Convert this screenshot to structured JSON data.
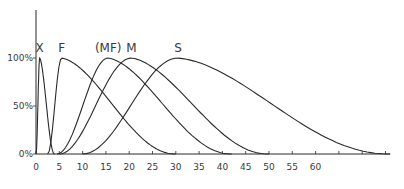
{
  "chart_data": {
    "type": "line",
    "title": "",
    "xlabel": "",
    "ylabel": "",
    "xlim": [
      0,
      76
    ],
    "ylim": [
      0,
      100
    ],
    "grid": false,
    "legend": "inline labels above peaks",
    "x_ticks": [
      0,
      5,
      10,
      15,
      20,
      25,
      30,
      35,
      40,
      45,
      50,
      55,
      60,
      65,
      70,
      75
    ],
    "x_tick_labels": [
      "0",
      "5",
      "10",
      "15",
      "20",
      "25",
      "30",
      "35",
      "40",
      "45",
      "50",
      "55",
      "60"
    ],
    "y_ticks": [
      0,
      50,
      100
    ],
    "y_tick_labels": [
      "0%",
      "50%",
      "100%"
    ],
    "series": [
      {
        "name": "X",
        "label": "X",
        "start": 0,
        "peak": 0.8,
        "end": 4,
        "label_x": 0.8
      },
      {
        "name": "F",
        "label": "F",
        "start": 2.5,
        "peak": 5.5,
        "end": 30,
        "label_x": 5.5
      },
      {
        "name": "MF",
        "label": "(MF)",
        "start": 4.5,
        "peak": 15.5,
        "end": 42,
        "label_x": 15.5
      },
      {
        "name": "M",
        "label": "M",
        "start": 5,
        "peak": 20.5,
        "end": 50,
        "label_x": 20.5
      },
      {
        "name": "S",
        "label": "S",
        "start": 10,
        "peak": 30.5,
        "end": 76,
        "label_x": 30.5
      }
    ]
  },
  "layout": {
    "origin_px": [
      36,
      154
    ],
    "px_per_x": 4.66,
    "px_per_pct": 0.96
  }
}
